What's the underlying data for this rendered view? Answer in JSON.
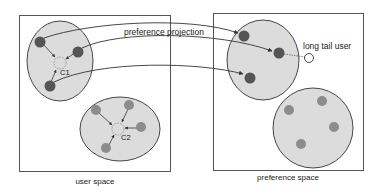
{
  "diagram": {
    "colors": {
      "box_stroke": "#555555",
      "cluster_fill": "#dcdcdc",
      "cluster_stroke": "#333333",
      "dark_node": "#555555",
      "light_node": "#8c8c8c",
      "arrow": "#333333",
      "centroid_stroke": "#888888"
    },
    "left_panel": {
      "caption": "user space",
      "clusters": [
        {
          "id": "C1",
          "label": "C1"
        },
        {
          "id": "C2",
          "label": "C2"
        }
      ]
    },
    "right_panel": {
      "caption": "preference space",
      "outlier_label": "long tail user"
    },
    "edge_label": "preference projection"
  }
}
